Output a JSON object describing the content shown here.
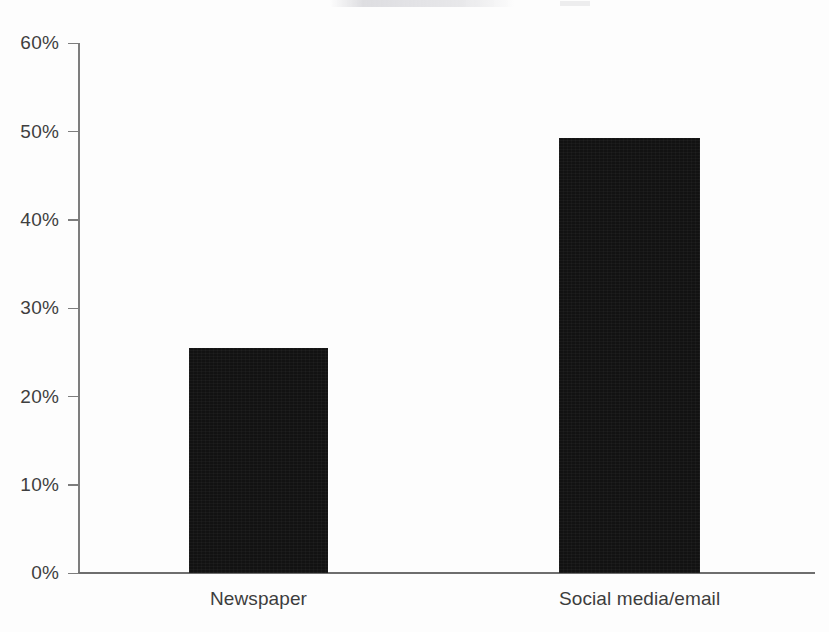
{
  "chart_data": {
    "type": "bar",
    "title": "",
    "subtitle": "",
    "xlabel": "",
    "ylabel": "",
    "categories": [
      "Newspaper",
      "Social media/email"
    ],
    "values": [
      25.5,
      49.2
    ],
    "series": [
      {
        "name": "Share of respondents",
        "values": [
          25.5,
          49.2
        ]
      }
    ],
    "ylim": [
      0,
      60
    ],
    "y_ticks": [
      0,
      10,
      20,
      30,
      40,
      50,
      60
    ],
    "y_tick_labels": [
      "0%",
      "10%",
      "20%",
      "30%",
      "40%",
      "50%",
      "60%"
    ],
    "value_format": "percent",
    "grid": false,
    "legend": false,
    "legend_position": "none",
    "annotations": [],
    "colors": {
      "bar": "#121212",
      "axis": "#7d7d7d",
      "tick_label": "#3f3f3f",
      "category_label": "#3d3d3d",
      "background": "#fdfdfd"
    }
  }
}
